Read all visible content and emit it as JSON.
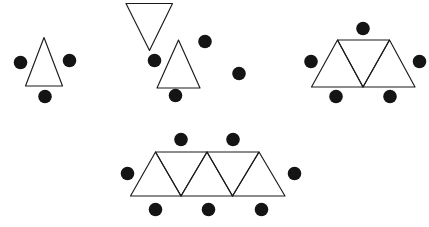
{
  "canvas": {
    "width": 429,
    "height": 227,
    "background_color": "#ffffff",
    "line_color": "#1b1b1b",
    "dot_color": "#141414",
    "line_width": 1.15
  },
  "figures": [
    {
      "id": "figure-1",
      "name": "one-triangle-three-dots",
      "triangle_count": 1,
      "dot_count": 7,
      "triangles": [
        {
          "orientation": "up",
          "points": "25.5,86 44,37.5 62.5,86"
        }
      ],
      "dots": [
        {
          "position": "left",
          "cx": 20.5,
          "cy": 62.5,
          "r": 6.8
        },
        {
          "position": "right",
          "cx": 69.5,
          "cy": 60.5,
          "r": 6.8
        },
        {
          "position": "bottom",
          "cx": 45.0,
          "cy": 96.5,
          "r": 6.8
        }
      ]
    },
    {
      "id": "figure-2",
      "name": "two-triangles-four-dots",
      "triangle_count": 2,
      "dot_count": 4,
      "triangles": [
        {
          "orientation": "down",
          "points": "126,3.5 172.5,3.5 149.5,50.5"
        },
        {
          "orientation": "up",
          "points": "157,88 178.5,40 200,88"
        }
      ],
      "dots": [
        {
          "position": "left",
          "cx": 154.5,
          "cy": 60.5,
          "r": 6.8
        },
        {
          "position": "upper-right",
          "cx": 205.0,
          "cy": 41.5,
          "r": 6.8
        },
        {
          "position": "right",
          "cx": 239.0,
          "cy": 73.5,
          "r": 6.8
        },
        {
          "position": "bottom",
          "cx": 175.5,
          "cy": 95.5,
          "r": 6.8
        }
      ]
    },
    {
      "id": "figure-3",
      "name": "three-triangles-five-dots",
      "triangle_count": 3,
      "dot_count": 5,
      "triangles": [
        {
          "orientation": "up",
          "points": "311.5,87 337.5,40 363,87"
        },
        {
          "orientation": "down",
          "points": "337.5,40 389.5,40 363,87"
        },
        {
          "orientation": "up",
          "points": "363,87 389.5,40 415,87"
        }
      ],
      "dots": [
        {
          "position": "top",
          "cx": 363.0,
          "cy": 28.5,
          "r": 6.8
        },
        {
          "position": "left",
          "cx": 311.0,
          "cy": 61.5,
          "r": 6.8
        },
        {
          "position": "right",
          "cx": 419.5,
          "cy": 61.5,
          "r": 6.8
        },
        {
          "position": "bottom-left",
          "cx": 336.0,
          "cy": 96.5,
          "r": 6.8
        },
        {
          "position": "bottom-right",
          "cx": 390.0,
          "cy": 96.5,
          "r": 6.8
        }
      ]
    },
    {
      "id": "figure-4",
      "name": "five-triangles-seven-dots",
      "triangle_count": 5,
      "dot_count": 7,
      "triangles": [
        {
          "orientation": "up",
          "points": "130.5,196 155.5,152 181,196"
        },
        {
          "orientation": "down",
          "points": "155.5,152 207,152 181,196"
        },
        {
          "orientation": "up",
          "points": "181,196 207,152 232.5,196"
        },
        {
          "orientation": "down",
          "points": "207,152 259,152 232.5,196"
        },
        {
          "orientation": "up",
          "points": "232.5,196 259,152 285,196"
        }
      ],
      "dots": [
        {
          "position": "top-left",
          "cx": 181.0,
          "cy": 139.5,
          "r": 6.8
        },
        {
          "position": "top-right",
          "cx": 233.0,
          "cy": 139.5,
          "r": 6.8
        },
        {
          "position": "left",
          "cx": 127.5,
          "cy": 173.5,
          "r": 6.8
        },
        {
          "position": "right",
          "cx": 294.5,
          "cy": 173.5,
          "r": 6.8
        },
        {
          "position": "bottom-left",
          "cx": 155.5,
          "cy": 209.5,
          "r": 6.8
        },
        {
          "position": "bottom-center",
          "cx": 208.5,
          "cy": 209.5,
          "r": 6.8
        },
        {
          "position": "bottom-right",
          "cx": 261.5,
          "cy": 209.5,
          "r": 6.8
        }
      ]
    }
  ]
}
